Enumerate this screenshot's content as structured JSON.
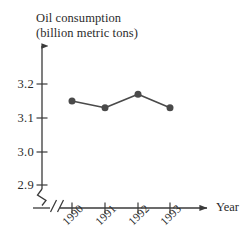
{
  "chart_data": {
    "type": "line",
    "title": "Oil consumption (billion metric tons)",
    "title_line1": "Oil consumption",
    "title_line2": "(billion metric tons)",
    "xlabel": "Year",
    "ylabel": "Oil consumption (billion metric tons)",
    "categories": [
      "1990",
      "1991",
      "1992",
      "1993"
    ],
    "values": [
      3.15,
      3.13,
      3.17,
      3.13
    ],
    "ytick_labels": [
      "3.2",
      "3.1",
      "3.0",
      "2.9"
    ],
    "ytick_values": [
      3.2,
      3.1,
      3.0,
      2.9
    ],
    "ylim": [
      2.9,
      3.25
    ],
    "grid": false,
    "legend": "none",
    "y_axis_break": true,
    "x_axis_break": true,
    "marker": "filled-circle",
    "series_color": "#4a4a4a",
    "axis_color": "#3a3a3a",
    "background_color": "#ffffff"
  },
  "axes": {
    "y_axis_arrow": "up-arrow-icon",
    "x_axis_arrow": "right-arrow-icon",
    "y_break_symbol": "zigzag-break",
    "x_break_symbol": "double-slash-break"
  }
}
